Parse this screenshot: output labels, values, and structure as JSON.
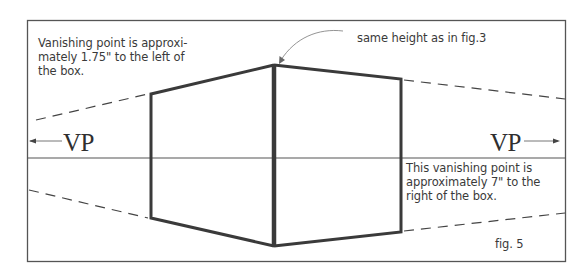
{
  "figure": {
    "caption": "fig. 5",
    "annotations": {
      "left_note": "Vanishing point is approxi-\nmately 1.75\" to the left of\nthe box.",
      "top_note": "same height as in fig.3",
      "right_note": "This vanishing point is\napproximately 7\" to the\nright of the box."
    },
    "vanishing_points": {
      "left_label": "VP",
      "right_label": "VP"
    },
    "colors": {
      "frame": "#555555",
      "box_edges": "#3a3a3a",
      "horizon": "#555555",
      "text": "#3a3a3a",
      "arrow": "#888888"
    }
  }
}
